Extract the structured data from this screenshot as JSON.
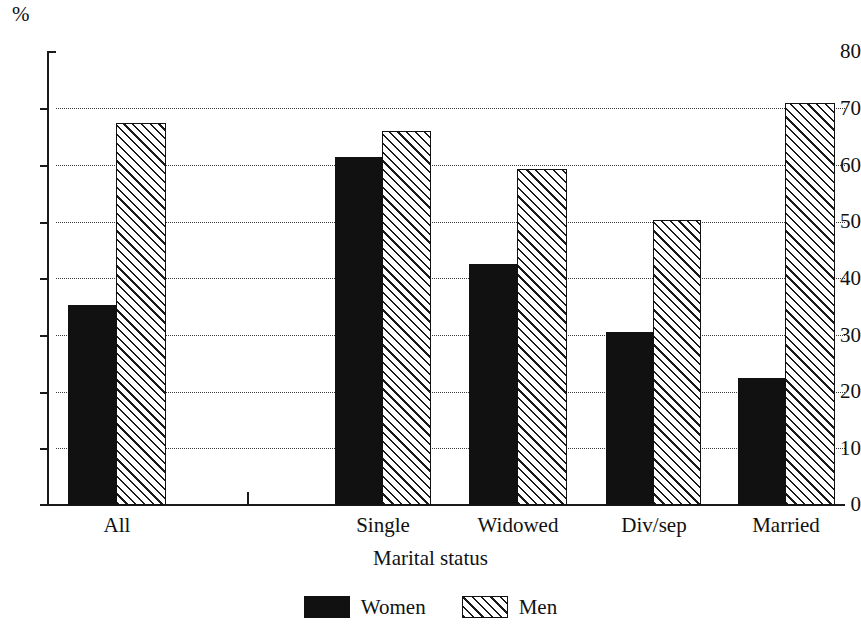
{
  "chart_data": {
    "type": "bar",
    "title": "",
    "xlabel": "Marital status",
    "ylabel": "%",
    "unit_label": "%",
    "categories": [
      "All",
      "Single",
      "Widowed",
      "Div/sep",
      "Married"
    ],
    "series": [
      {
        "name": "Women",
        "fill": "solid-black",
        "values": [
          35.2,
          61.4,
          42.4,
          30.5,
          22.3
        ]
      },
      {
        "name": "Men",
        "fill": "diagonal-hatch",
        "values": [
          67.4,
          65.9,
          59.2,
          50.2,
          70.8
        ]
      }
    ],
    "ylim": [
      0,
      80
    ],
    "yticks": [
      0,
      10,
      20,
      30,
      40,
      50,
      60,
      70,
      80
    ],
    "ytick_labels": [
      "0",
      "10",
      "20",
      "30",
      "40",
      "50",
      "60",
      "70",
      "80"
    ],
    "grid": true,
    "grid_style": "dotted-horizontal",
    "legend_position": "bottom-center",
    "colors": {
      "women": "#111111",
      "men_outline": "#111111",
      "men_fill": "#ffffff",
      "axis": "#1a1a1a",
      "grid": "#3a3a3a"
    }
  },
  "legend": {
    "items": [
      {
        "label": "Women",
        "swatch": "solid-black-swatch"
      },
      {
        "label": "Men",
        "swatch": "hatched-swatch"
      }
    ]
  }
}
